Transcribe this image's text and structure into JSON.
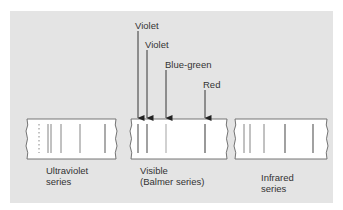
{
  "diagram": {
    "background_color": "#e4e4e4",
    "strip_color": "#ffffff",
    "line_color": "#777777",
    "strips": [
      {
        "name": "ultraviolet",
        "label_line1": "Ultraviolet",
        "label_line2": "series",
        "lines_x": [
          48,
          51,
          61,
          80,
          105
        ],
        "has_dotted_limit": true
      },
      {
        "name": "visible",
        "label_line1": "Visible",
        "label_line2": "(Balmer series)",
        "lines_x": [
          138,
          147,
          166,
          205
        ]
      },
      {
        "name": "infrared",
        "label_line1": "Infrared",
        "label_line2": "series",
        "lines_x": [
          244,
          250,
          264,
          285,
          313
        ]
      }
    ],
    "arrows": [
      {
        "label": "Violet",
        "x": 138
      },
      {
        "label": "Violet",
        "x": 147
      },
      {
        "label": "Blue-green",
        "x": 166
      },
      {
        "label": "Red",
        "x": 205
      }
    ]
  }
}
